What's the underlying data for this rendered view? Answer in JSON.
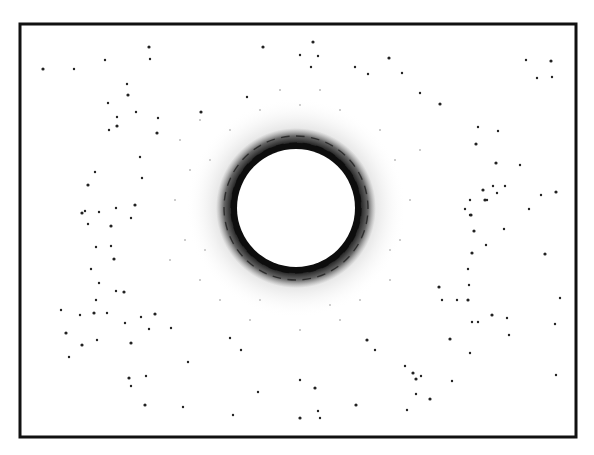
{
  "figure": {
    "kind": "diffraction pattern photograph",
    "frame": {
      "x": 20,
      "y": 24,
      "width": 556,
      "height": 413,
      "stroke": "#111111",
      "stroke_width": 3
    },
    "ring": {
      "center": [
        296,
        208
      ],
      "inner_radius": 59,
      "band_outer_radius": 80,
      "halo_radius": 110,
      "colors": {
        "band": "#0d0d0d",
        "halo": "#bdbdbd",
        "hole": "#ffffff"
      }
    },
    "background": "#ffffff",
    "spot_color": "#222222",
    "spots": [
      [
        43,
        69
      ],
      [
        74,
        69
      ],
      [
        105,
        60
      ],
      [
        149,
        47
      ],
      [
        150,
        59
      ],
      [
        127,
        84
      ],
      [
        128,
        95
      ],
      [
        108,
        103
      ],
      [
        117,
        117
      ],
      [
        117,
        126
      ],
      [
        109,
        130
      ],
      [
        136,
        112
      ],
      [
        157,
        133
      ],
      [
        140,
        157
      ],
      [
        142,
        178
      ],
      [
        88,
        185
      ],
      [
        95,
        172
      ],
      [
        85,
        211
      ],
      [
        82,
        213
      ],
      [
        99,
        212
      ],
      [
        116,
        208
      ],
      [
        135,
        205
      ],
      [
        131,
        218
      ],
      [
        88,
        224
      ],
      [
        111,
        226
      ],
      [
        96,
        247
      ],
      [
        111,
        246
      ],
      [
        114,
        259
      ],
      [
        91,
        269
      ],
      [
        116,
        291
      ],
      [
        124,
        292
      ],
      [
        99,
        283
      ],
      [
        96,
        300
      ],
      [
        94,
        313
      ],
      [
        107,
        313
      ],
      [
        141,
        317
      ],
      [
        155,
        314
      ],
      [
        171,
        328
      ],
      [
        61,
        310
      ],
      [
        66,
        333
      ],
      [
        80,
        315
      ],
      [
        69,
        357
      ],
      [
        82,
        345
      ],
      [
        97,
        340
      ],
      [
        125,
        323
      ],
      [
        131,
        343
      ],
      [
        149,
        329
      ],
      [
        188,
        362
      ],
      [
        129,
        378
      ],
      [
        146,
        376
      ],
      [
        183,
        407
      ],
      [
        145,
        405
      ],
      [
        131,
        386
      ],
      [
        233,
        415
      ],
      [
        300,
        418
      ],
      [
        318,
        411
      ],
      [
        320,
        418
      ],
      [
        356,
        405
      ],
      [
        407,
        410
      ],
      [
        478,
        127
      ],
      [
        476,
        144
      ],
      [
        498,
        131
      ],
      [
        505,
        186
      ],
      [
        483,
        190
      ],
      [
        493,
        186
      ],
      [
        497,
        193
      ],
      [
        485,
        200
      ],
      [
        470,
        200
      ],
      [
        465,
        209
      ],
      [
        471,
        215
      ],
      [
        487,
        200
      ],
      [
        541,
        195
      ],
      [
        556,
        192
      ],
      [
        529,
        209
      ],
      [
        470,
        215
      ],
      [
        474,
        231
      ],
      [
        504,
        229
      ],
      [
        486,
        245
      ],
      [
        472,
        253
      ],
      [
        468,
        269
      ],
      [
        469,
        285
      ],
      [
        439,
        287
      ],
      [
        442,
        300
      ],
      [
        457,
        300
      ],
      [
        468,
        300
      ],
      [
        478,
        322
      ],
      [
        509,
        335
      ],
      [
        450,
        339
      ],
      [
        470,
        353
      ],
      [
        472,
        322
      ],
      [
        492,
        315
      ],
      [
        507,
        318
      ],
      [
        421,
        376
      ],
      [
        416,
        379
      ],
      [
        452,
        381
      ],
      [
        416,
        394
      ],
      [
        430,
        399
      ],
      [
        556,
        375
      ],
      [
        560,
        298
      ],
      [
        545,
        254
      ],
      [
        555,
        324
      ],
      [
        526,
        60
      ],
      [
        551,
        61
      ],
      [
        537,
        78
      ],
      [
        552,
        77
      ],
      [
        496,
        163
      ],
      [
        520,
        165
      ],
      [
        158,
        118
      ],
      [
        201,
        112
      ],
      [
        247,
        97
      ],
      [
        300,
        55
      ],
      [
        313,
        42
      ],
      [
        311,
        67
      ],
      [
        318,
        56
      ],
      [
        263,
        47
      ],
      [
        355,
        67
      ],
      [
        368,
        74
      ],
      [
        389,
        58
      ],
      [
        402,
        73
      ],
      [
        420,
        93
      ],
      [
        440,
        104
      ],
      [
        230,
        338
      ],
      [
        241,
        350
      ],
      [
        367,
        340
      ],
      [
        375,
        350
      ],
      [
        405,
        366
      ],
      [
        413,
        373
      ],
      [
        258,
        392
      ],
      [
        300,
        380
      ],
      [
        315,
        388
      ]
    ],
    "faint_spots": [
      [
        180,
        140
      ],
      [
        200,
        120
      ],
      [
        190,
        170
      ],
      [
        175,
        200
      ],
      [
        185,
        240
      ],
      [
        200,
        280
      ],
      [
        220,
        300
      ],
      [
        260,
        300
      ],
      [
        330,
        305
      ],
      [
        360,
        300
      ],
      [
        390,
        280
      ],
      [
        400,
        240
      ],
      [
        410,
        200
      ],
      [
        395,
        160
      ],
      [
        380,
        130
      ],
      [
        340,
        110
      ],
      [
        300,
        105
      ],
      [
        260,
        110
      ],
      [
        230,
        130
      ],
      [
        210,
        160
      ],
      [
        205,
        250
      ],
      [
        390,
        250
      ],
      [
        250,
        320
      ],
      [
        340,
        320
      ],
      [
        300,
        330
      ],
      [
        280,
        90
      ],
      [
        320,
        90
      ],
      [
        420,
        150
      ],
      [
        170,
        260
      ]
    ]
  }
}
